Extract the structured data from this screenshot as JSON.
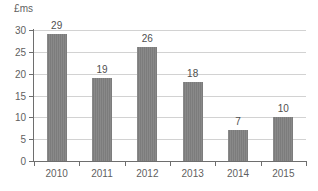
{
  "chart_data": {
    "type": "bar",
    "title": "",
    "subtitle": "",
    "xlabel": "",
    "ylabel": "£ms",
    "categories": [
      "2010",
      "2011",
      "2012",
      "2013",
      "2014",
      "2015"
    ],
    "values": [
      29,
      19,
      26,
      18,
      7,
      10
    ],
    "value_labels": [
      "29",
      "19",
      "26",
      "18",
      "7",
      "10"
    ],
    "ylim": [
      0,
      30
    ],
    "ytick_values": [
      0,
      5,
      10,
      15,
      20,
      25,
      30
    ],
    "ytick_labels": [
      "0",
      "5",
      "10",
      "15",
      "20",
      "25",
      "30"
    ],
    "grid": "horizontal",
    "legend": "none",
    "series": [
      {
        "name": "£ms",
        "values": [
          29,
          19,
          26,
          18,
          7,
          10
        ]
      }
    ],
    "colors": {
      "bar": "#808080",
      "gridline": "#d2d2d2",
      "axis": "#6e6e6e",
      "tick_text": "#5f5f5f",
      "value_text": "#4f4f4f",
      "background": "#ffffff"
    }
  }
}
